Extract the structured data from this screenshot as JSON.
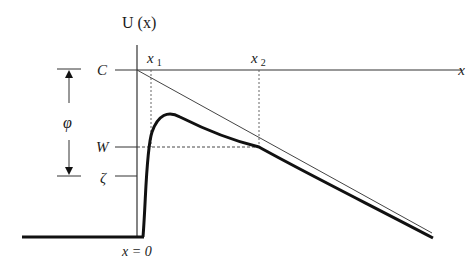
{
  "diagram": {
    "y_axis_label": "U (x)",
    "x_axis_label": "x",
    "origin_label": "x = 0",
    "levels": [
      {
        "name": "C",
        "label": "C"
      },
      {
        "name": "W",
        "label": "W"
      },
      {
        "name": "zeta",
        "label": "ζ"
      }
    ],
    "positions": [
      {
        "name": "x1",
        "base": "x",
        "sub": "1"
      },
      {
        "name": "x2",
        "base": "x",
        "sub": "2"
      }
    ],
    "dimension": {
      "label": "φ",
      "from": "C",
      "to": "ζ"
    },
    "curves": [
      {
        "name": "potential-curve",
        "style": "thick solid"
      },
      {
        "name": "applied-field-line",
        "style": "thin solid"
      },
      {
        "name": "W-level-line",
        "style": "dashed"
      },
      {
        "name": "x1-drop-line",
        "style": "dotted"
      },
      {
        "name": "x2-drop-line",
        "style": "dotted"
      }
    ],
    "colors": {
      "ink": "#1a1a1a",
      "thin": "#444444",
      "background": "#ffffff"
    }
  }
}
